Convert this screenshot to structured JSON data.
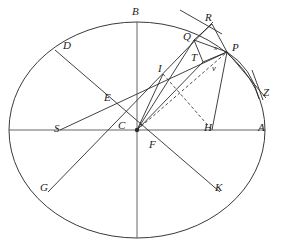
{
  "figure": {
    "canvas": {
      "width": 282,
      "height": 243
    },
    "colors": {
      "stroke": "#2b2b2b",
      "ellipse": "#3a3a3a",
      "axis": "#555555",
      "dashed": "#3a3a3a",
      "label": "#1a1a1a",
      "background": "#ffffff"
    },
    "ellipse": {
      "cx": 137,
      "cy": 130,
      "rx": 128,
      "ry": 108
    },
    "points": [
      {
        "id": "A",
        "label": "A",
        "x": 265,
        "y": 130,
        "lx": 258,
        "ly": 122,
        "size": "normal"
      },
      {
        "id": "B",
        "label": "B",
        "x": 137,
        "y": 22,
        "lx": 132,
        "ly": 6,
        "size": "normal"
      },
      {
        "id": "C",
        "label": "C",
        "x": 137,
        "y": 130,
        "lx": 118,
        "ly": 120,
        "size": "normal"
      },
      {
        "id": "D",
        "label": "D",
        "x": 55,
        "y": 50,
        "lx": 63,
        "ly": 40,
        "size": "normal"
      },
      {
        "id": "E",
        "label": "E",
        "x": 110,
        "y": 102,
        "lx": 104,
        "ly": 92,
        "size": "normal"
      },
      {
        "id": "F",
        "label": "F",
        "x": 155,
        "y": 145,
        "lx": 149,
        "ly": 139,
        "size": "normal"
      },
      {
        "id": "G",
        "label": "G",
        "x": 48,
        "y": 192,
        "lx": 40,
        "ly": 182,
        "size": "normal"
      },
      {
        "id": "H",
        "label": "H",
        "x": 212,
        "y": 130,
        "lx": 204,
        "ly": 122,
        "size": "normal"
      },
      {
        "id": "I",
        "label": "I",
        "x": 163,
        "y": 74,
        "lx": 158,
        "ly": 63,
        "size": "normal"
      },
      {
        "id": "K",
        "label": "K",
        "x": 220,
        "y": 192,
        "lx": 215,
        "ly": 182,
        "size": "normal"
      },
      {
        "id": "P",
        "label": "P",
        "x": 227,
        "y": 52,
        "lx": 232,
        "ly": 42,
        "size": "normal"
      },
      {
        "id": "Q",
        "label": "Q",
        "x": 194,
        "y": 40,
        "lx": 183,
        "ly": 31,
        "size": "normal"
      },
      {
        "id": "R",
        "label": "R",
        "x": 210,
        "y": 25,
        "lx": 205,
        "ly": 12,
        "size": "normal"
      },
      {
        "id": "S",
        "label": "S",
        "x": 60,
        "y": 130,
        "lx": 54,
        "ly": 123,
        "size": "normal"
      },
      {
        "id": "T",
        "label": "T",
        "x": 203,
        "y": 62,
        "lx": 191,
        "ly": 52,
        "size": "normal"
      },
      {
        "id": "Z",
        "label": "Z",
        "x": 264,
        "y": 96,
        "lx": 263,
        "ly": 87,
        "size": "normal"
      },
      {
        "id": "v",
        "label": "v",
        "x": 215,
        "y": 70,
        "lx": 212,
        "ly": 64,
        "size": "small"
      },
      {
        "id": "x",
        "label": "x",
        "x": 218,
        "y": 51,
        "lx": 214,
        "ly": 45,
        "size": "tiny"
      }
    ],
    "segments": [
      {
        "name": "major-axis-SA",
        "from": [
          9,
          130
        ],
        "to": [
          265,
          130
        ],
        "style": "axis"
      },
      {
        "name": "minor-axis-B-bottom",
        "from": [
          137,
          22
        ],
        "to": [
          137,
          238
        ],
        "style": "axis"
      },
      {
        "name": "diameter-D-K",
        "from": [
          55,
          50
        ],
        "to": [
          220,
          192
        ],
        "style": "solid"
      },
      {
        "name": "diameter-G-R-upper",
        "from": [
          48,
          192
        ],
        "to": [
          213,
          22
        ],
        "style": "solid"
      },
      {
        "name": "chord-S-to-P",
        "from": [
          60,
          130
        ],
        "to": [
          227,
          52
        ],
        "style": "solid"
      },
      {
        "name": "radius-C-to-P",
        "from": [
          137,
          130
        ],
        "to": [
          227,
          52
        ],
        "style": "dashed"
      },
      {
        "name": "ordinate-H-to-P",
        "from": [
          212,
          130
        ],
        "to": [
          227,
          52
        ],
        "style": "solid"
      },
      {
        "name": "line-I-to-H",
        "from": [
          163,
          74
        ],
        "to": [
          212,
          130
        ],
        "style": "dashed"
      },
      {
        "name": "line-C-to-I-extended",
        "from": [
          137,
          130
        ],
        "to": [
          163,
          74
        ],
        "style": "solid"
      },
      {
        "name": "line-C-to-T",
        "from": [
          137,
          130
        ],
        "to": [
          203,
          62
        ],
        "style": "solid"
      },
      {
        "name": "line-C-to-Q",
        "from": [
          137,
          130
        ],
        "to": [
          194,
          40
        ],
        "style": "solid"
      },
      {
        "name": "line-Q-to-P",
        "from": [
          194,
          40
        ],
        "to": [
          227,
          52
        ],
        "style": "solid"
      },
      {
        "name": "line-Q-to-T",
        "from": [
          194,
          40
        ],
        "to": [
          203,
          62
        ],
        "style": "solid"
      },
      {
        "name": "line-Q-to-R",
        "from": [
          194,
          40
        ],
        "to": [
          212,
          24
        ],
        "style": "solid"
      },
      {
        "name": "line-T-to-P",
        "from": [
          203,
          62
        ],
        "to": [
          227,
          52
        ],
        "style": "solid"
      },
      {
        "name": "line-R-to-P",
        "from": [
          212,
          24
        ],
        "to": [
          227,
          52
        ],
        "style": "solid"
      },
      {
        "name": "tangent-through-R",
        "from": [
          180,
          10
        ],
        "to": [
          222,
          34
        ],
        "style": "solid"
      },
      {
        "name": "line-P-to-Z",
        "from": [
          227,
          52
        ],
        "to": [
          266,
          98
        ],
        "style": "solid"
      },
      {
        "name": "line-Z-tick",
        "from": [
          252,
          70
        ],
        "to": [
          263,
          100
        ],
        "style": "solid"
      }
    ],
    "arcs": [
      {
        "name": "arc-P-to-Z",
        "d": "M 227 52 Q 252 68 259 99",
        "style": "solid"
      }
    ],
    "dots": [
      {
        "name": "center-dot-C",
        "x": 137,
        "y": 130,
        "r": 2.2
      }
    ]
  }
}
